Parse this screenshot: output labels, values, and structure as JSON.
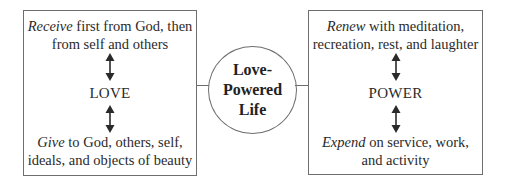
{
  "left": {
    "top_emphasis": "Receive",
    "top_rest_line1": " first from God, then",
    "top_line2": "from self and others",
    "core": "LOVE",
    "bottom_emphasis": "Give",
    "bottom_rest_line1": " to God, others, self,",
    "bottom_line2": "ideals, and objects of beauty"
  },
  "center": {
    "line1": "Love-",
    "line2": "Powered",
    "line3": "Life"
  },
  "right": {
    "top_emphasis": "Renew",
    "top_rest_line1": " with meditation,",
    "top_line2": "recreation, rest, and laughter",
    "core": "POWER",
    "bottom_emphasis": "Expend",
    "bottom_rest_line1": " on service, work,",
    "bottom_line2": "and activity"
  },
  "icons": {
    "arrow": "double-headed-vertical-arrow"
  },
  "colors": {
    "line": "#6e6e6e",
    "text": "#2a2a2a"
  }
}
